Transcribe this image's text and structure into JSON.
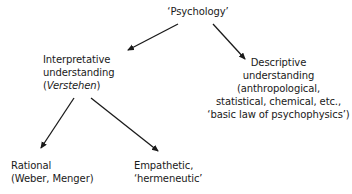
{
  "diagram": {
    "type": "tree",
    "nodes": {
      "root": {
        "lines": [
          "‘Psychology’"
        ]
      },
      "interpretative": {
        "lines": [
          "Interpretative",
          "understanding"
        ],
        "paren_open": "(",
        "italic_term": "Verstehen",
        "paren_close": ")"
      },
      "descriptive": {
        "lines": [
          "Descriptive",
          "understanding",
          "(anthropological,",
          "statistical, chemical, etc.,",
          "‘basic law of psychophysics’)"
        ]
      },
      "rational": {
        "lines": [
          "Rational",
          "(Weber, Menger)"
        ]
      },
      "empathetic": {
        "lines": [
          "Empathetic,",
          "‘hermeneutic’"
        ]
      }
    },
    "edges": [
      {
        "from": "root",
        "to": "interpretative"
      },
      {
        "from": "root",
        "to": "descriptive"
      },
      {
        "from": "interpretative",
        "to": "rational"
      },
      {
        "from": "interpretative",
        "to": "empathetic"
      }
    ],
    "colors": {
      "text": "#1a1a1a",
      "arrow": "#1a1a1a",
      "background": "#ffffff"
    }
  }
}
